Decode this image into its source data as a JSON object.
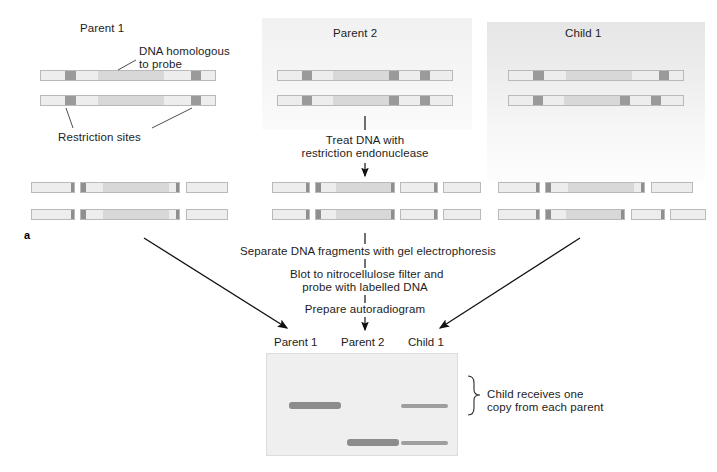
{
  "figure": {
    "panel_letter": "a",
    "width": 717,
    "height": 472
  },
  "panels": [
    {
      "id": "parent1",
      "title": "Parent 1"
    },
    {
      "id": "parent2",
      "title": "Parent 2"
    },
    {
      "id": "child1",
      "title": "Child 1"
    }
  ],
  "annotations": {
    "probe_label_line1": "DNA homologous",
    "probe_label_line2": "to probe",
    "restriction_sites": "Restriction sites",
    "conclusion_line1": "Child receives one",
    "conclusion_line2": "copy from each parent"
  },
  "steps": {
    "treat_line1": "Treat DNA with",
    "treat_line2": "restriction endonuclease",
    "separate": "Separate DNA fragments with gel electrophoresis",
    "blot_line1": "Blot to nitrocellulose filter and",
    "blot_line2": "probe with labelled DNA",
    "autoradiogram": "Prepare autoradiogram"
  },
  "gel": {
    "lanes": [
      {
        "label": "Parent 1"
      },
      {
        "label": "Parent 2"
      },
      {
        "label": "Child 1"
      }
    ],
    "bands": [
      {
        "lane": "Parent 1",
        "position": "high",
        "intensity": "strong"
      },
      {
        "lane": "Parent 2",
        "position": "low",
        "intensity": "strong"
      },
      {
        "lane": "Child 1",
        "position": "high",
        "intensity": "faint"
      },
      {
        "lane": "Child 1",
        "position": "low",
        "intensity": "faint"
      }
    ]
  },
  "colors": {
    "bar_fill": "#ededed",
    "probe_segment": "#d8d8d8",
    "restriction_site": "#9a9a9a",
    "band_strong": "#8c8c8c",
    "band_faint": "#a5a5a5",
    "gel_background": "#efefef",
    "arrow": "#111111"
  },
  "chromosomes": {
    "parent1": {
      "restriction_site_count": 2,
      "fragment_count": 3
    },
    "parent2": {
      "restriction_site_count": 3,
      "fragment_count": 4
    },
    "child1": {
      "allele_from_parent1_sites": 2,
      "allele_from_parent2_sites": 3
    }
  }
}
